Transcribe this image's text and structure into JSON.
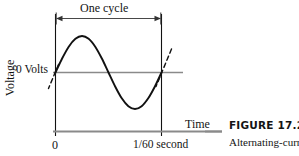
{
  "figure": {
    "caption_title": "FIGURE 17.2",
    "caption_body": "Alternating-current"
  },
  "chart_data": {
    "type": "line",
    "title": "",
    "xlabel": "Time",
    "ylabel": "Voltage",
    "x_tick_labels": [
      "0",
      "1/60 second"
    ],
    "x_tick_values": [
      0,
      0.016667
    ],
    "y_tick_labels": [
      "0 Volts"
    ],
    "y_tick_values": [
      0
    ],
    "xlim": [
      0,
      0.016667
    ],
    "ylim": [
      -1,
      1
    ],
    "grid": false,
    "legend": null,
    "annotations": [
      {
        "name": "one-cycle-span",
        "text": "One cycle",
        "from_x": 0,
        "to_x": 0.016667,
        "style": "double-headed-arrow"
      },
      {
        "name": "tangent-at-origin",
        "text": "",
        "style": "dashed-tangent"
      },
      {
        "name": "tangent-at-period",
        "text": "",
        "style": "dashed-tangent"
      }
    ],
    "series": [
      {
        "name": "Alternating voltage",
        "equation": "sin(2*pi*60*t)",
        "x": [
          0,
          0.00104,
          0.00208,
          0.00313,
          0.00417,
          0.00521,
          0.00625,
          0.00729,
          0.00833,
          0.00938,
          0.01042,
          0.01146,
          0.0125,
          0.01354,
          0.01458,
          0.01563,
          0.016667
        ],
        "values": [
          0,
          0.383,
          0.707,
          0.924,
          1,
          0.924,
          0.707,
          0.383,
          0,
          -0.383,
          -0.707,
          -0.924,
          -1,
          -0.924,
          -0.707,
          -0.383,
          0
        ]
      }
    ],
    "colors": {
      "curve": "#111111",
      "axis": "#111111",
      "zero_line": "#8a8a8a",
      "time_axis": "#8a8a8a",
      "annotation": "#333333"
    }
  },
  "labels": {
    "one_cycle": "One cycle",
    "zero_volts": "0 Volts",
    "voltage": "Voltage",
    "time": "Time",
    "tick_zero": "0",
    "tick_period": "1/60 second"
  }
}
